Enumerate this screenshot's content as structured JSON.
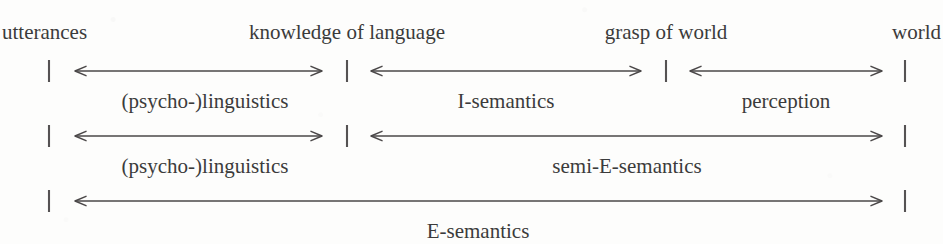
{
  "figure": {
    "ink_color": "#3b3b3b",
    "line_color": "#4a4748",
    "background": "#fdfdfc"
  },
  "nodes": [
    {
      "id": "utterances",
      "label": "utterances",
      "x": 2,
      "align": "left"
    },
    {
      "id": "knowledge-of-language",
      "label": "knowledge of language",
      "x": 347,
      "align": "center"
    },
    {
      "id": "grasp-of-world",
      "label": "grasp of world",
      "x": 666,
      "align": "center"
    },
    {
      "id": "world",
      "label": "world",
      "x": 941,
      "align": "right"
    }
  ],
  "ticks": [
    {
      "row": 1,
      "x": 49
    },
    {
      "row": 1,
      "x": 347
    },
    {
      "row": 1,
      "x": 666
    },
    {
      "row": 1,
      "x": 905
    },
    {
      "row": 2,
      "x": 49
    },
    {
      "row": 2,
      "x": 347
    },
    {
      "row": 2,
      "x": 905
    },
    {
      "row": 3,
      "x": 49
    },
    {
      "row": 3,
      "x": 905
    }
  ],
  "rows": [
    {
      "id": "row-1",
      "y": 71,
      "label_y": 91,
      "spans": [
        {
          "id": "psycho-linguistics-1",
          "label": "(psycho-)linguistics",
          "x1": 75,
          "x2": 322,
          "label_x": 205
        },
        {
          "id": "i-semantics",
          "label": "I-semantics",
          "x1": 371,
          "x2": 641,
          "label_x": 506
        },
        {
          "id": "perception",
          "label": "perception",
          "x1": 690,
          "x2": 882,
          "label_x": 786
        }
      ]
    },
    {
      "id": "row-2",
      "y": 136,
      "label_y": 156,
      "spans": [
        {
          "id": "psycho-linguistics-2",
          "label": "(psycho-)linguistics",
          "x1": 75,
          "x2": 322,
          "label_x": 205
        },
        {
          "id": "semi-e-semantics",
          "label": "semi-E-semantics",
          "x1": 371,
          "x2": 882,
          "label_x": 627
        }
      ]
    },
    {
      "id": "row-3",
      "y": 201,
      "label_y": 221,
      "spans": [
        {
          "id": "e-semantics",
          "label": "E-semantics",
          "x1": 75,
          "x2": 882,
          "label_x": 478
        }
      ]
    }
  ]
}
